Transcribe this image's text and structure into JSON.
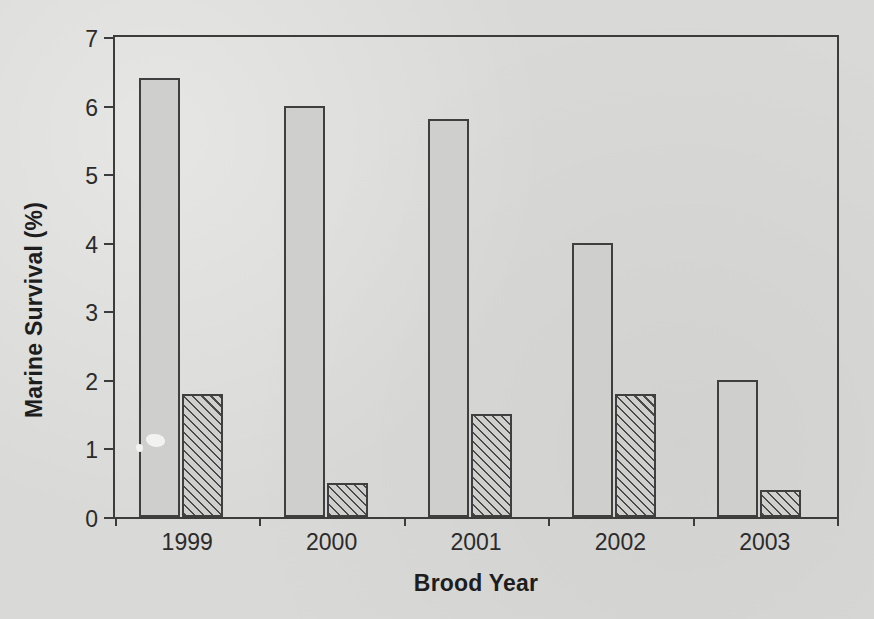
{
  "chart_data": {
    "type": "bar",
    "title": "",
    "xlabel": "Brood Year",
    "ylabel": "Marine Survival (%)",
    "categories": [
      "1999",
      "2000",
      "2001",
      "2002",
      "2003"
    ],
    "series": [
      {
        "name": "series-1-solid",
        "fill": "solid-gray",
        "values": [
          6.4,
          6.0,
          5.8,
          4.0,
          2.0
        ]
      },
      {
        "name": "series-2-hatched",
        "fill": "diagonal-hatch",
        "values": [
          1.8,
          0.5,
          1.5,
          1.8,
          0.4
        ]
      }
    ],
    "ylim": [
      0,
      7
    ],
    "ytick_labels": [
      "0",
      "1",
      "2",
      "3",
      "4",
      "5",
      "6",
      "7"
    ],
    "ytick_values": [
      0,
      1,
      2,
      3,
      4,
      5,
      6,
      7
    ],
    "grid": false,
    "legend": "none",
    "frame": "full-box",
    "colors": {
      "background": "#d9d9d7",
      "bar_fill": "#cfcfcd",
      "bar_stroke": "#3f3f3f",
      "axis": "#3c3c3c",
      "text": "#1d1d1d"
    }
  }
}
